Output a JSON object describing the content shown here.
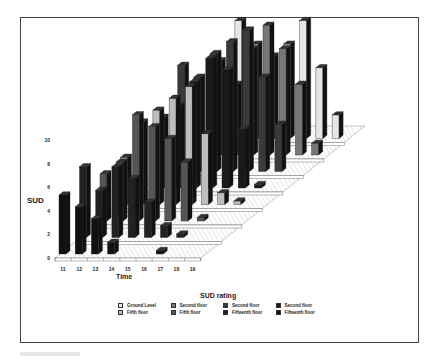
{
  "chart_data": {
    "type": "bar",
    "subtype": "3d-bar-grouped-by-depth",
    "title": "",
    "xlabel": "Time",
    "ylabel": "SUD",
    "legend_title": "SUD rating",
    "ylim": [
      0,
      10
    ],
    "yticks": [
      "0",
      "2",
      "4",
      "6",
      "8",
      "10"
    ],
    "categories": [
      "11",
      "12",
      "13",
      "14",
      "15",
      "16",
      "17",
      "18",
      "19"
    ],
    "legend_position": "bottom",
    "grid": true,
    "series": [
      {
        "name": "Ground Level",
        "color": "#e6e6e6",
        "values": [
          null,
          null,
          10,
          8,
          7,
          8,
          10,
          6,
          2
        ]
      },
      {
        "name": "Second floor",
        "color": "#777777",
        "values": [
          null,
          null,
          8,
          6,
          9,
          11,
          9,
          6,
          1
        ]
      },
      {
        "name": "Second floor",
        "color": "#3a3a3a",
        "values": [
          null,
          9,
          8,
          10,
          11,
          12,
          8,
          4,
          null
        ]
      },
      {
        "name": "Second floor",
        "color": "#1a1a1a",
        "values": [
          null,
          6,
          7,
          9,
          11,
          10,
          5,
          0.3,
          null
        ]
      },
      {
        "name": "Fifth floor",
        "color": "#bdbdbd",
        "values": [
          4,
          7,
          8,
          9,
          10,
          6,
          1,
          0.3,
          null
        ]
      },
      {
        "name": "Fifth floor",
        "color": "#555555",
        "values": [
          4,
          5,
          9,
          8,
          7,
          5,
          0.3,
          null,
          null
        ]
      },
      {
        "name": "Fifteenth floor",
        "color": "#222222",
        "values": [
          6,
          4,
          6,
          5,
          3,
          1,
          0.3,
          null,
          null
        ]
      },
      {
        "name": "Fifteenth floor",
        "color": "#111111",
        "values": [
          5,
          4,
          3,
          1,
          null,
          null,
          0.3,
          null,
          null
        ]
      }
    ]
  },
  "legend": {
    "title": "SUD rating",
    "items": [
      {
        "label": "Ground Level",
        "color": "#e6e6e6"
      },
      {
        "label": "Second floor",
        "color": "#777777"
      },
      {
        "label": "Second floor",
        "color": "#3a3a3a"
      },
      {
        "label": "Second floor",
        "color": "#1a1a1a"
      },
      {
        "label": "Fifth floor",
        "color": "#bdbdbd"
      },
      {
        "label": "Fifth floor",
        "color": "#555555"
      },
      {
        "label": "Fifteenth floor",
        "color": "#222222"
      },
      {
        "label": "Fifteenth floor",
        "color": "#111111"
      }
    ]
  },
  "axes": {
    "y_label": "SUD",
    "x_label": "Time",
    "y_ticks": [
      "0",
      "2",
      "4",
      "6",
      "8",
      "10"
    ],
    "x_ticks": [
      "11",
      "12",
      "13",
      "14",
      "15",
      "16",
      "17",
      "18",
      "19"
    ]
  }
}
